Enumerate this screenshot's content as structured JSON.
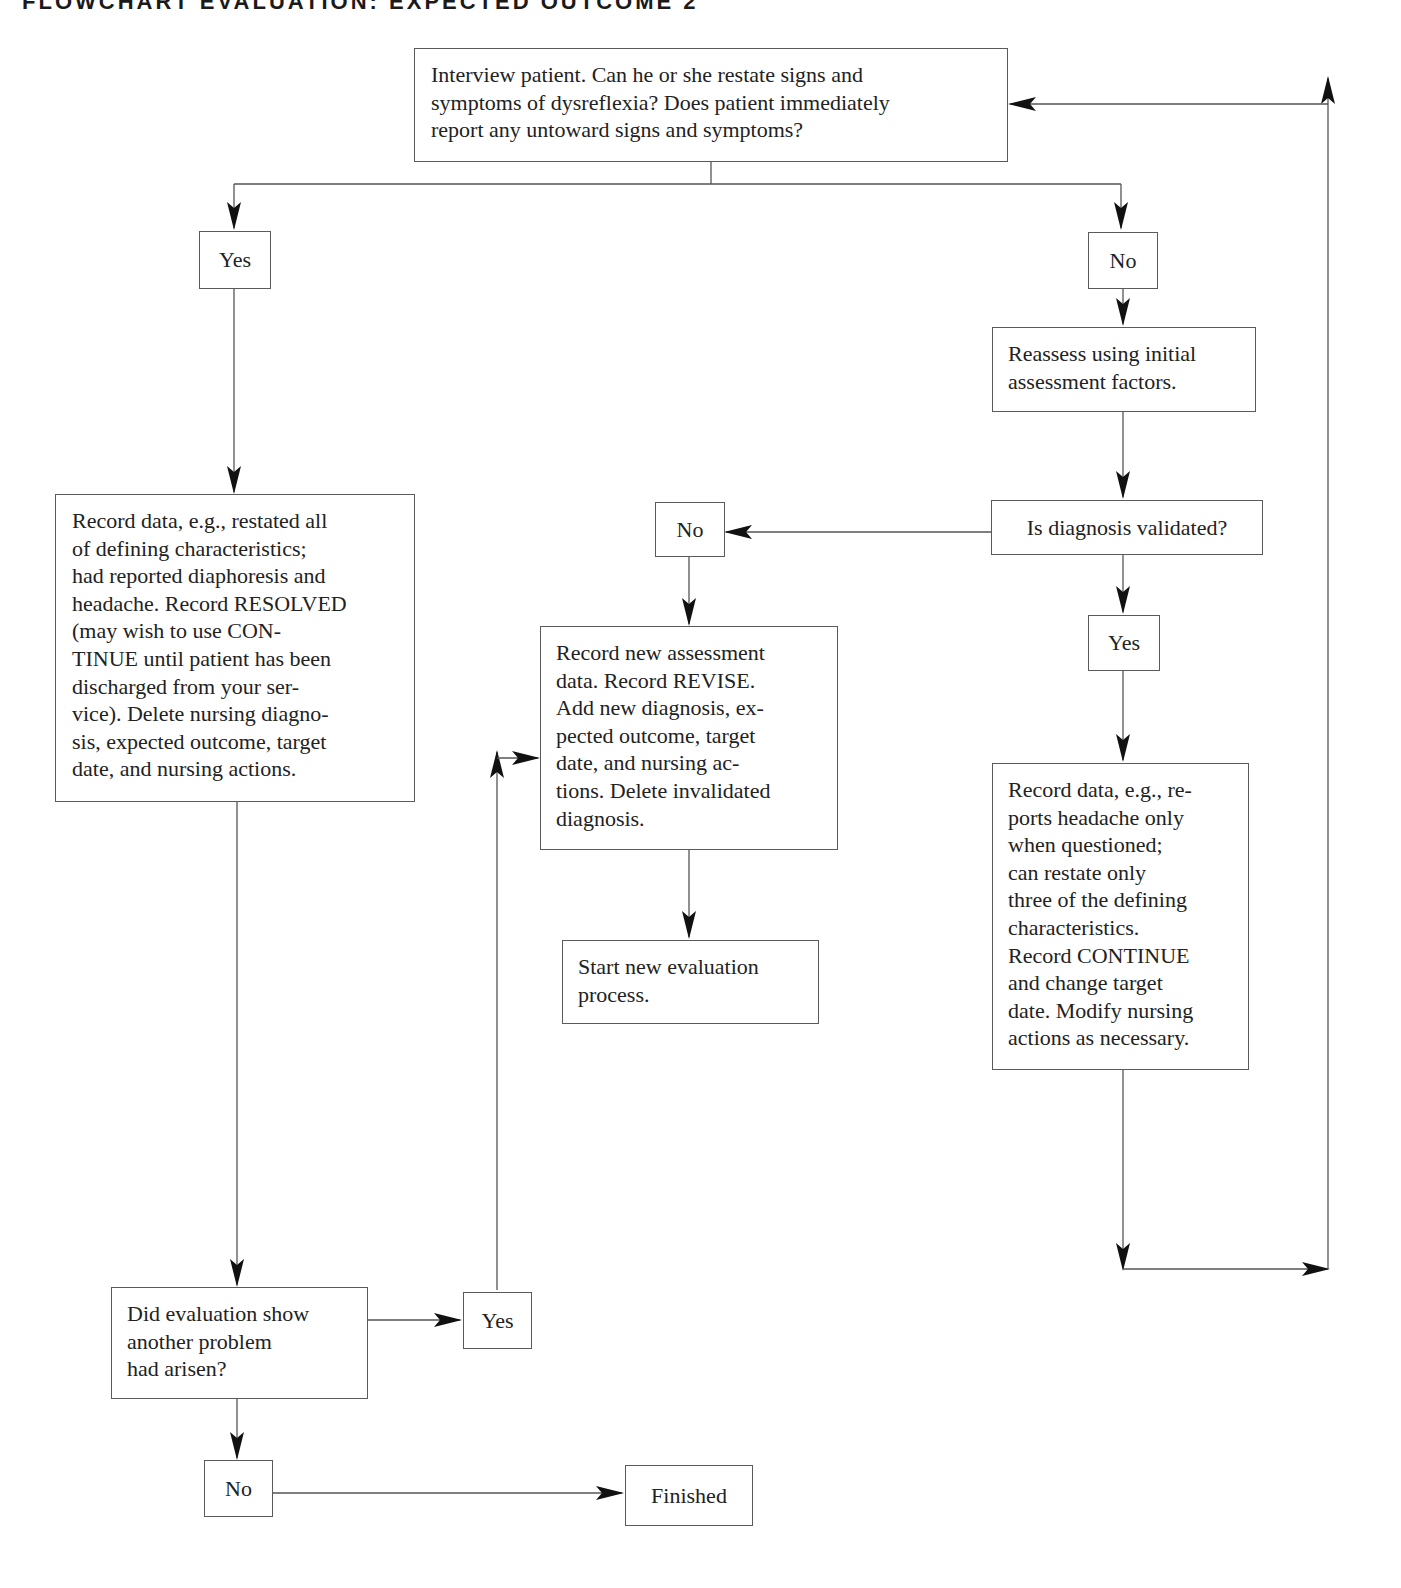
{
  "title": "FLOWCHART EVALUATION: EXPECTED OUTCOME 2",
  "nodes": {
    "interview": {
      "text": "Interview patient. Can he or she restate signs and\nsymptoms of dysreflexia? Does patient immediately\nreport any untoward signs and symptoms?"
    },
    "yes_top": {
      "text": "Yes"
    },
    "no_top": {
      "text": "No"
    },
    "reassess": {
      "text": "Reassess using initial\nassessment factors."
    },
    "validated": {
      "text": "Is diagnosis validated?"
    },
    "no_validated": {
      "text": "No"
    },
    "yes_validated": {
      "text": "Yes"
    },
    "record_resolved": {
      "text": "Record data, e.g., restated all\nof defining characteristics;\nhad reported diaphoresis and\nheadache. Record RESOLVED\n(may wish to use CON-\nTINUE until patient has been\ndischarged from your ser-\nvice). Delete nursing diagno-\nsis, expected outcome, target\ndate, and nursing actions."
    },
    "record_revise": {
      "text": "Record new assessment\ndata. Record REVISE.\nAdd new diagnosis, ex-\npected outcome, target\ndate, and nursing ac-\ntions. Delete invalidated\ndiagnosis."
    },
    "start_new": {
      "text": "Start new evaluation\nprocess."
    },
    "record_continue": {
      "text": "Record data, e.g., re-\nports headache only\nwhen questioned;\ncan restate only\nthree of the defining\ncharacteristics.\nRecord CONTINUE\nand change target\ndate. Modify nursing\nactions as necessary."
    },
    "another_problem": {
      "text": "Did evaluation show\nanother problem\nhad arisen?"
    },
    "yes_problem": {
      "text": "Yes"
    },
    "no_problem": {
      "text": "No"
    },
    "finished": {
      "text": "Finished"
    }
  },
  "colors": {
    "line": "#555555",
    "arrow": "#111111",
    "text": "#222222"
  }
}
